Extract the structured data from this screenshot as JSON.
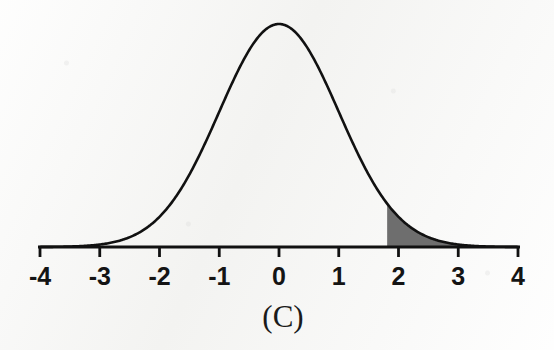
{
  "figure": {
    "caption": "(C)",
    "background_color": "#f6f6f4",
    "curve_color": "#111111",
    "axis_color": "#111111",
    "shade_color": "#6e6e6e"
  },
  "axis": {
    "label": "z",
    "ticks": [
      {
        "value": -4,
        "label": "-4"
      },
      {
        "value": -3,
        "label": "-3"
      },
      {
        "value": -2,
        "label": "-2"
      },
      {
        "value": -1,
        "label": "-1"
      },
      {
        "value": 0,
        "label": "0"
      },
      {
        "value": 1,
        "label": "1"
      },
      {
        "value": 2,
        "label": "2"
      },
      {
        "value": 3,
        "label": "3"
      },
      {
        "value": 4,
        "label": "4"
      }
    ]
  },
  "chart_data": {
    "type": "area",
    "title": "(C)",
    "subtitle": "",
    "xlabel": "",
    "ylabel": "",
    "grid": false,
    "legend": null,
    "xlim": [
      -4,
      4
    ],
    "ylim": [
      0,
      0.42
    ],
    "distribution": "standard normal",
    "mean": 0,
    "sd": 1,
    "series": [
      {
        "name": "Standard normal density",
        "kind": "line",
        "x": [
          -4,
          -3.5,
          -3,
          -2.5,
          -2,
          -1.5,
          -1,
          -0.5,
          0,
          0.5,
          1,
          1.5,
          2,
          2.5,
          3,
          3.5,
          4
        ],
        "values": [
          0.0001,
          0.0009,
          0.0044,
          0.0175,
          0.054,
          0.1295,
          0.242,
          0.3521,
          0.3989,
          0.3521,
          0.242,
          0.1295,
          0.054,
          0.0175,
          0.0044,
          0.0009,
          0.0001
        ]
      },
      {
        "name": "Shaded upper tail",
        "kind": "area",
        "x_start": 1.81,
        "x_end": 4,
        "fill": "#6e6e6e",
        "area": 0.035,
        "values": [
          0.0773,
          0.054,
          0.0175,
          0.0044,
          0.0009,
          0.0001
        ]
      }
    ],
    "xticks": [
      -4,
      -3,
      -2,
      -1,
      0,
      1,
      2,
      3,
      4
    ],
    "xticklabels": [
      "-4",
      "-3",
      "-2",
      "-1",
      "0",
      "1",
      "2",
      "3",
      "4"
    ],
    "yticks": [],
    "yticklabels": [],
    "annotations": [
      {
        "text": "(C)",
        "role": "panel-label",
        "x": 0,
        "y": -0.09
      }
    ]
  }
}
